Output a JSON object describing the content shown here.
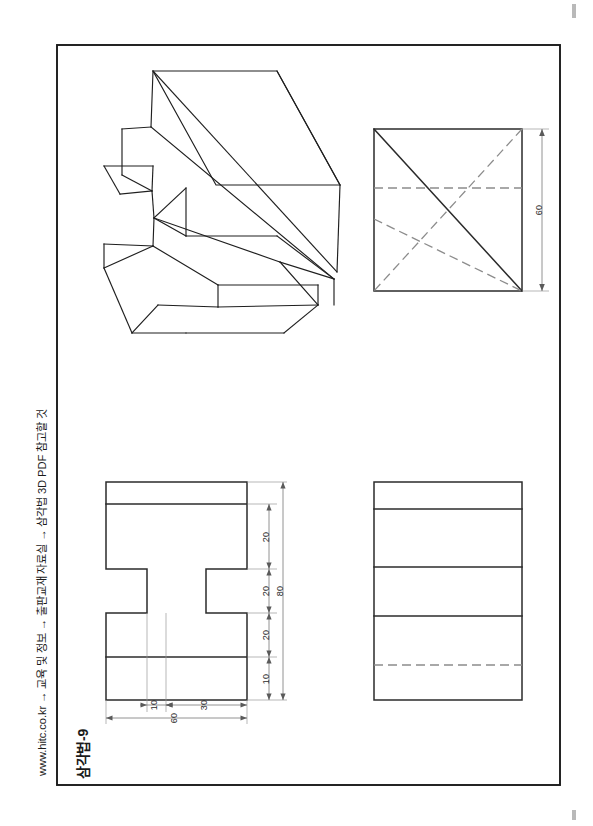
{
  "page": {
    "width": 593,
    "height": 826,
    "background": "#ffffff",
    "border_color": "#1a1a1a"
  },
  "sidebar": {
    "source_note": "www.hitc.co.kr → 교육 및 정보 → 출판교재 자료실 → 삼각법 3D PDF 참고할 것",
    "sheet_title": "삼각법-9"
  },
  "views": {
    "isometric": {
      "name": "isometric-pictorial-view",
      "label": ""
    },
    "right_side": {
      "name": "right-side-view",
      "dimensions": [
        {
          "value": "60",
          "orientation": "vertical",
          "position": "right"
        }
      ]
    },
    "front": {
      "name": "front-view",
      "dimensions": [
        {
          "value": "20",
          "orientation": "vertical",
          "position": "right"
        },
        {
          "value": "20",
          "orientation": "vertical",
          "position": "right"
        },
        {
          "value": "20",
          "orientation": "vertical",
          "position": "right"
        },
        {
          "value": "10",
          "orientation": "vertical",
          "position": "right"
        },
        {
          "value": "80",
          "orientation": "vertical",
          "position": "right-outer"
        },
        {
          "value": "10",
          "orientation": "horizontal",
          "position": "bottom"
        },
        {
          "value": "30",
          "orientation": "horizontal",
          "position": "bottom"
        },
        {
          "value": "60",
          "orientation": "horizontal",
          "position": "bottom-outer"
        }
      ]
    },
    "top": {
      "name": "top-view",
      "dimensions": []
    }
  },
  "dim_values": {
    "side_60": "60",
    "front_v1": "20",
    "front_v2": "20",
    "front_v3": "20",
    "front_v4": "10",
    "front_total_v": "80",
    "front_h1": "10",
    "front_h2": "30",
    "front_total_h": "60"
  },
  "colors": {
    "object_line": "#2b2b2b",
    "hidden_line": "#8c8c8c",
    "dimension_line": "#6e6e6e",
    "frame": "#1a1a1a",
    "paper": "#ffffff"
  }
}
